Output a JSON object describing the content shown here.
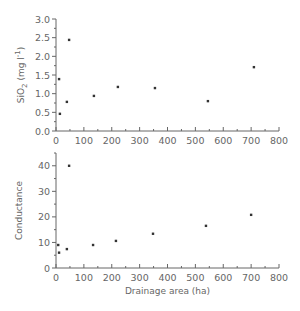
{
  "chart_data": [
    {
      "type": "scatter",
      "title": "",
      "xlabel": "",
      "ylabel": "SiO2 (mg l-1)",
      "ylabel_parts": {
        "main": "SiO",
        "sub": "2",
        "unit_open": " (mg l",
        "sup": "-1",
        "unit_close": ")"
      },
      "xlim": [
        0,
        800
      ],
      "ylim": [
        0,
        3.0
      ],
      "x_ticks": [
        "0",
        "100",
        "200",
        "300",
        "400",
        "500",
        "600",
        "700",
        "800"
      ],
      "y_ticks": [
        "0.0",
        "0.5",
        "1.0",
        "1.5",
        "2.0",
        "2.5",
        "3.0"
      ],
      "grid": false,
      "series": [
        {
          "name": "SiO2",
          "x": [
            11,
            14,
            39,
            47,
            136,
            222,
            355,
            545,
            710
          ],
          "y": [
            1.39,
            0.46,
            0.78,
            2.44,
            0.94,
            1.18,
            1.15,
            0.8,
            1.71
          ]
        }
      ]
    },
    {
      "type": "scatter",
      "title": "",
      "xlabel": "Drainage area (ha)",
      "ylabel": "Conductance",
      "xlim": [
        0,
        800
      ],
      "ylim": [
        0,
        45
      ],
      "x_ticks": [
        "0",
        "100",
        "200",
        "300",
        "400",
        "500",
        "600",
        "700",
        "800"
      ],
      "y_ticks": [
        "0",
        "10",
        "20",
        "30",
        "40"
      ],
      "grid": false,
      "series": [
        {
          "name": "Conductance",
          "x": [
            8,
            11,
            39,
            47,
            133,
            215,
            348,
            538,
            700
          ],
          "y": [
            9,
            6,
            7.4,
            40,
            9,
            10.6,
            13.4,
            16.5,
            20.8
          ]
        }
      ]
    }
  ]
}
